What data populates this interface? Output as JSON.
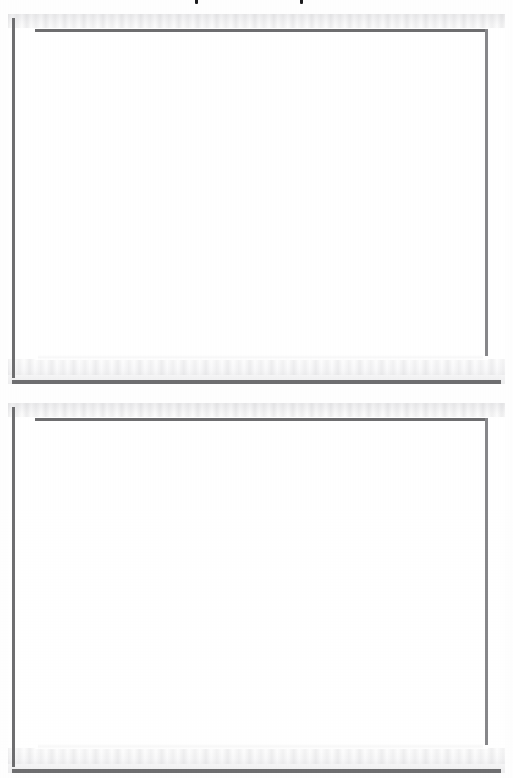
{
  "document": {
    "type": "scanned-page",
    "page_background_color": "#fefefe",
    "paper_color": "#ffffff",
    "width_px": 513,
    "height_px": 778,
    "visible_text": "",
    "note_label": ""
  },
  "clipped_text_top": {
    "description": "two cut-off letter descenders clipped at the very top edge of the scan",
    "mark_color": "#1d1d1f",
    "marks": [
      {
        "label": "",
        "x_px": 195
      },
      {
        "label": "",
        "x_px": 300
      }
    ]
  },
  "panels": [
    {
      "id": "frame-panel-1",
      "caption": "",
      "content": "",
      "top_px": 14,
      "left_px": 8,
      "width_px": 497,
      "height_px": 370,
      "rule_color": "#6e6e70",
      "rule_color_light": "#87878a",
      "fill_color": "#ffffff",
      "is_blank": "true"
    },
    {
      "id": "frame-panel-2",
      "caption": "",
      "content": "",
      "top_px": 403,
      "left_px": 8,
      "width_px": 497,
      "height_px": 370,
      "rule_color": "#6e6e70",
      "rule_color_light": "#87878a",
      "fill_color": "#ffffff",
      "is_blank": "true"
    }
  ]
}
